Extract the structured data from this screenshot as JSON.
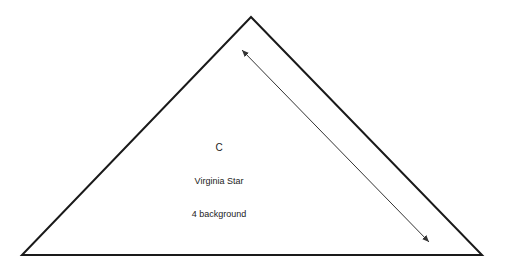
{
  "diagram": {
    "type": "quilt-template-triangle",
    "piece_letter": "C",
    "pattern_name": "Virginia Star",
    "cut_instruction": "4 background",
    "colors": {
      "stroke": "#1a1a1a",
      "arrow": "#333333",
      "text": "#222222",
      "background": "#ffffff"
    },
    "shape": {
      "apex": [
        251,
        17
      ],
      "bottom_left": [
        22,
        255
      ],
      "bottom_right": [
        482,
        255
      ]
    },
    "grain_arrow": {
      "start": [
        242,
        50
      ],
      "end": [
        429,
        242
      ],
      "double_headed": true
    }
  }
}
